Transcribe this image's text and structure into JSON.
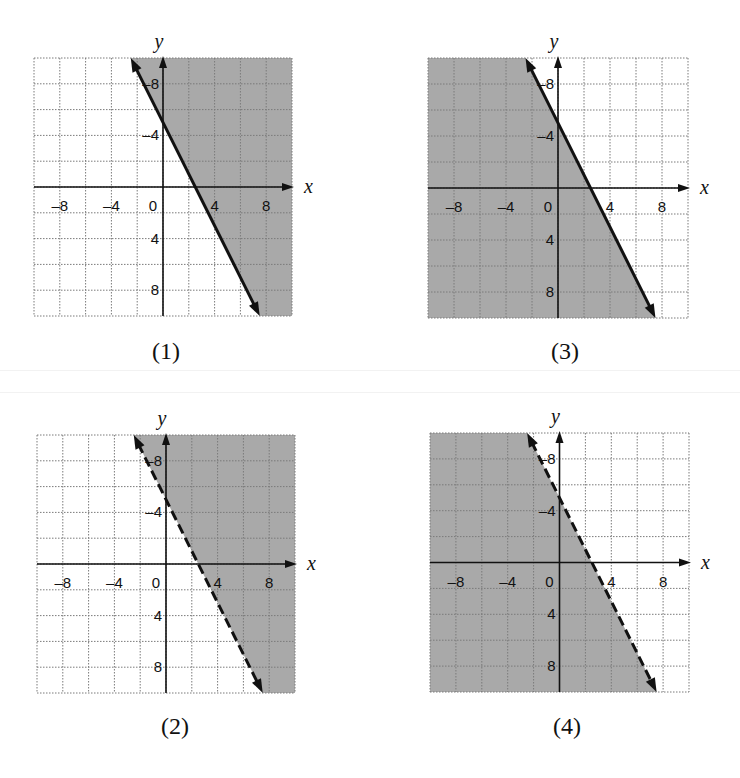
{
  "figure": {
    "style": {
      "shade_color": "#a9a9a9",
      "grid_color": "#7a7a7a",
      "axis_color": "#111111",
      "line_color": "#111111"
    },
    "axis_labels": {
      "x": "x",
      "y": "y"
    },
    "x_ticks": [
      "–8",
      "–4",
      "0",
      "4",
      "8"
    ],
    "y_ticks": [
      "8",
      "4",
      "–4",
      "–8"
    ]
  },
  "panels": [
    {
      "id": "1",
      "caption": "(1)",
      "line_style": "solid",
      "shade": "right",
      "inequality": "y ≥ -2x + 5"
    },
    {
      "id": "3",
      "caption": "(3)",
      "line_style": "solid",
      "shade": "left",
      "inequality": "y ≤ -2x + 5"
    },
    {
      "id": "2",
      "caption": "(2)",
      "line_style": "dashed",
      "shade": "right",
      "inequality": "y > -2x + 5"
    },
    {
      "id": "4",
      "caption": "(4)",
      "line_style": "dashed",
      "shade": "left",
      "inequality": "y < -2x + 5"
    }
  ],
  "chart_data": [
    {
      "type": "line",
      "title": "(1)",
      "xlabel": "x",
      "ylabel": "y",
      "xlim": [
        -10,
        10
      ],
      "ylim": [
        -10,
        10
      ],
      "x_ticks": [
        -8,
        -4,
        0,
        4,
        8
      ],
      "y_ticks": [
        -8,
        -4,
        4,
        8
      ],
      "grid": true,
      "series": [
        {
          "name": "boundary y = -2x + 5",
          "style": "solid",
          "x": [
            -2.5,
            7.5
          ],
          "y": [
            10,
            -10
          ]
        }
      ],
      "shaded_region": "right of line (y ≥ -2x + 5)"
    },
    {
      "type": "line",
      "title": "(3)",
      "xlabel": "x",
      "ylabel": "y",
      "xlim": [
        -10,
        10
      ],
      "ylim": [
        -10,
        10
      ],
      "x_ticks": [
        -8,
        -4,
        0,
        4,
        8
      ],
      "y_ticks": [
        -8,
        -4,
        4,
        8
      ],
      "grid": true,
      "series": [
        {
          "name": "boundary y = -2x + 5",
          "style": "solid",
          "x": [
            -2.5,
            7.5
          ],
          "y": [
            10,
            -10
          ]
        }
      ],
      "shaded_region": "left of line (y ≤ -2x + 5)"
    },
    {
      "type": "line",
      "title": "(2)",
      "xlabel": "x",
      "ylabel": "y",
      "xlim": [
        -10,
        10
      ],
      "ylim": [
        -10,
        10
      ],
      "x_ticks": [
        -8,
        -4,
        0,
        4,
        8
      ],
      "y_ticks": [
        -8,
        -4,
        4,
        8
      ],
      "grid": true,
      "series": [
        {
          "name": "boundary y = -2x + 5",
          "style": "dashed",
          "x": [
            -2.5,
            7.5
          ],
          "y": [
            10,
            -10
          ]
        }
      ],
      "shaded_region": "right of line (y > -2x + 5)"
    },
    {
      "type": "line",
      "title": "(4)",
      "xlabel": "x",
      "ylabel": "y",
      "xlim": [
        -10,
        10
      ],
      "ylim": [
        -10,
        10
      ],
      "x_ticks": [
        -8,
        -4,
        0,
        4,
        8
      ],
      "y_ticks": [
        -8,
        -4,
        4,
        8
      ],
      "grid": true,
      "series": [
        {
          "name": "boundary y = -2x + 5",
          "style": "dashed",
          "x": [
            -2.5,
            7.5
          ],
          "y": [
            10,
            -10
          ]
        }
      ],
      "shaded_region": "left of line (y < -2x + 5)"
    }
  ]
}
